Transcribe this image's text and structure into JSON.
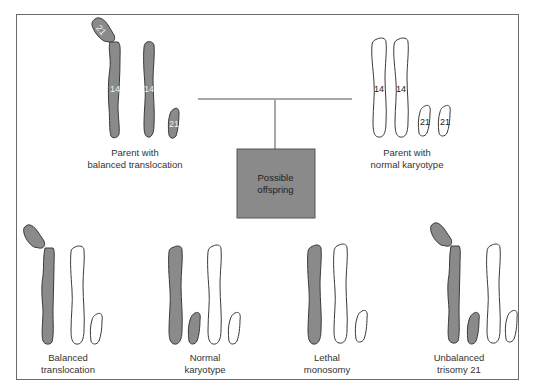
{
  "colors": {
    "shaded": "#8a8a8a",
    "outline": "#3a3a3a",
    "connector": "#a8a8a8",
    "box_fill": "#8a8a8a",
    "frame": "#6b6b6b"
  },
  "parents": {
    "left": {
      "label_line1": "Parent with",
      "label_line2": "balanced translocation",
      "chromosomes": [
        {
          "id": "14-21-fused",
          "label": "14",
          "shaded": true,
          "attached_label": "21"
        },
        {
          "id": "14",
          "label": "14",
          "shaded": true
        },
        {
          "id": "21",
          "label": "21",
          "shaded": true
        }
      ]
    },
    "right": {
      "label_line1": "Parent with",
      "label_line2": "normal karyotype",
      "chromosomes": [
        {
          "id": "14a",
          "label": "14",
          "shaded": false
        },
        {
          "id": "14b",
          "label": "14",
          "shaded": false
        },
        {
          "id": "21a",
          "label": "21",
          "shaded": false
        },
        {
          "id": "21b",
          "label": "21",
          "shaded": false
        }
      ]
    }
  },
  "offspring_box": {
    "line1": "Possible",
    "line2": "offspring"
  },
  "offspring": [
    {
      "label_line1": "Balanced",
      "label_line2": "translocation"
    },
    {
      "label_line1": "Normal",
      "label_line2": "karyotype"
    },
    {
      "label_line1": "Lethal",
      "label_line2": "monosomy"
    },
    {
      "label_line1": "Unbalanced",
      "label_line2": "trisomy 21"
    }
  ]
}
